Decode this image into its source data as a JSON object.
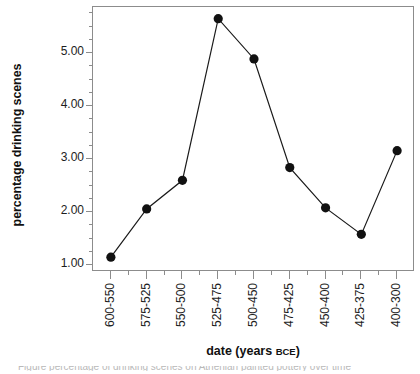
{
  "chart_data": {
    "type": "line",
    "title": "",
    "xlabel": "date (years BCE)",
    "xlabel_main": "date (years ",
    "xlabel_smallcaps": "BCE",
    "xlabel_tail": ")",
    "ylabel": "percentage drinking scenes",
    "categories": [
      "600-550",
      "575-525",
      "550-500",
      "525-475",
      "500-450",
      "475-425",
      "450-400",
      "425-375",
      "400-300"
    ],
    "values": [
      1.13,
      2.04,
      2.58,
      5.63,
      4.87,
      2.82,
      2.06,
      1.56,
      3.14
    ],
    "ylim": [
      0.85,
      5.85
    ],
    "ytick_values": [
      1.0,
      2.0,
      3.0,
      4.0,
      5.0
    ],
    "ytick_labels": [
      "1.00",
      "2.00",
      "3.00",
      "4.00",
      "5.00"
    ],
    "yminor_step": 0.25,
    "grid": false,
    "legend": false,
    "marker": "filled-circle",
    "marker_color": "#111111",
    "line_color": "#1a1a1a",
    "frame_color": "#8c8c8c"
  },
  "caption": {
    "cut_off_text": "Figure  percentage of drinking scenes on Athenian painted pottery over time"
  }
}
